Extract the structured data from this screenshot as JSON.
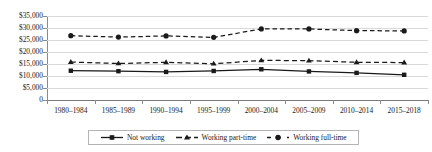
{
  "chart_data": {
    "type": "line",
    "title": "",
    "subtitle": "",
    "xlabel": "",
    "ylabel": "",
    "categories": [
      "1980–1984",
      "1985–1989",
      "1990–1994",
      "1995–1999",
      "2000–2004",
      "2005–2009",
      "2010–2014",
      "2015–2018"
    ],
    "ytick_labels": [
      "$35,000",
      "$30,000",
      "$25,000",
      "$20,000",
      "$15,000",
      "$10,000",
      "$5,000",
      "0"
    ],
    "ytick_values": [
      35000,
      30000,
      25000,
      20000,
      15000,
      10000,
      5000,
      0
    ],
    "ylim": [
      0,
      35000
    ],
    "grid": true,
    "legend_position": "bottom",
    "series": [
      {
        "name": "Not working",
        "marker": "square",
        "line_style": "solid",
        "color": "#1a1a1a",
        "values": [
          12200,
          12000,
          11700,
          12100,
          12800,
          11900,
          11300,
          10500
        ]
      },
      {
        "name": "Working part-time",
        "marker": "triangle",
        "line_style": "dashed",
        "color": "#1a1a1a",
        "values": [
          15800,
          15200,
          15700,
          15100,
          16500,
          16400,
          15700,
          15600
        ]
      },
      {
        "name": "Working full-time",
        "marker": "circle",
        "line_style": "dashed",
        "color": "#1a1a1a",
        "values": [
          26800,
          26200,
          26700,
          26100,
          29600,
          29600,
          28900,
          28800
        ]
      }
    ]
  },
  "legend": {
    "items": [
      {
        "label": "Not working",
        "marker": "square",
        "line_style": "solid"
      },
      {
        "label": "Working part-time",
        "marker": "triangle",
        "line_style": "dashed"
      },
      {
        "label": "Working full-time",
        "marker": "circle",
        "line_style": "dashed-spaced"
      }
    ]
  }
}
